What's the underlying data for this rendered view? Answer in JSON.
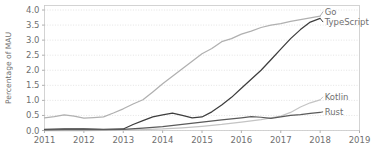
{
  "chart_data": {
    "type": "line",
    "title": "",
    "xlabel": "",
    "ylabel": "Percentage of MAU",
    "xlim": [
      2011,
      2019
    ],
    "ylim": [
      0.0,
      4.15
    ],
    "grid": true,
    "legend_position": "right-inline-labels",
    "xticks": [
      "2011",
      "2012",
      "2013",
      "2014",
      "2015",
      "2016",
      "2017",
      "2018",
      "2019"
    ],
    "yticks": [
      "0.0",
      "0.5",
      "1.0",
      "1.5",
      "2.0",
      "2.5",
      "3.0",
      "3.5",
      "4.0"
    ],
    "ytick_values": [
      0.0,
      0.5,
      1.0,
      1.5,
      2.0,
      2.5,
      3.0,
      3.5,
      4.0
    ],
    "series": [
      {
        "name": "Go",
        "color": "#b0b0b0",
        "label_y_value": 3.95,
        "x": [
          2011.0,
          2011.25,
          2011.5,
          2011.75,
          2012.0,
          2012.25,
          2012.5,
          2012.75,
          2013.0,
          2013.25,
          2013.5,
          2013.75,
          2014.0,
          2014.25,
          2014.5,
          2014.75,
          2015.0,
          2015.25,
          2015.5,
          2015.75,
          2016.0,
          2016.25,
          2016.5,
          2016.75,
          2017.0,
          2017.25,
          2017.5,
          2017.75,
          2018.0
        ],
        "values": [
          0.42,
          0.46,
          0.52,
          0.48,
          0.41,
          0.43,
          0.45,
          0.58,
          0.72,
          0.88,
          1.02,
          1.28,
          1.55,
          1.8,
          2.05,
          2.3,
          2.55,
          2.72,
          2.95,
          3.05,
          3.2,
          3.3,
          3.42,
          3.5,
          3.55,
          3.62,
          3.68,
          3.74,
          3.8
        ]
      },
      {
        "name": "TypeScript",
        "color": "#3d3d3d",
        "label_y_value": 3.6,
        "x": [
          2011.0,
          2011.5,
          2012.0,
          2012.5,
          2013.0,
          2013.25,
          2013.5,
          2013.75,
          2014.0,
          2014.25,
          2014.5,
          2014.75,
          2015.0,
          2015.25,
          2015.5,
          2015.75,
          2016.0,
          2016.25,
          2016.5,
          2016.75,
          2017.0,
          2017.25,
          2017.5,
          2017.75,
          2018.0
        ],
        "values": [
          0.04,
          0.05,
          0.05,
          0.04,
          0.05,
          0.2,
          0.33,
          0.45,
          0.52,
          0.58,
          0.5,
          0.42,
          0.45,
          0.62,
          0.85,
          1.1,
          1.4,
          1.7,
          2.0,
          2.35,
          2.7,
          3.05,
          3.35,
          3.6,
          3.72
        ]
      },
      {
        "name": "Kotlin",
        "color": "#c4c4c4",
        "label_y_value": 1.12,
        "x": [
          2011.0,
          2012.0,
          2013.0,
          2013.5,
          2014.0,
          2014.5,
          2015.0,
          2015.5,
          2016.0,
          2016.5,
          2017.0,
          2017.25,
          2017.5,
          2017.75,
          2018.0
        ],
        "values": [
          0.0,
          0.0,
          0.01,
          0.03,
          0.05,
          0.09,
          0.14,
          0.2,
          0.28,
          0.36,
          0.48,
          0.6,
          0.78,
          0.92,
          1.02
        ]
      },
      {
        "name": "Rust",
        "color": "#5a5a5a",
        "label_y_value": 0.62,
        "x": [
          2011.0,
          2011.5,
          2012.0,
          2012.5,
          2013.0,
          2013.5,
          2014.0,
          2014.5,
          2015.0,
          2015.5,
          2016.0,
          2016.25,
          2016.5,
          2016.75,
          2017.0,
          2017.25,
          2017.5,
          2017.75,
          2018.0
        ],
        "values": [
          0.02,
          0.03,
          0.04,
          0.03,
          0.04,
          0.08,
          0.13,
          0.2,
          0.28,
          0.35,
          0.42,
          0.46,
          0.44,
          0.4,
          0.45,
          0.5,
          0.53,
          0.57,
          0.6
        ]
      }
    ]
  }
}
